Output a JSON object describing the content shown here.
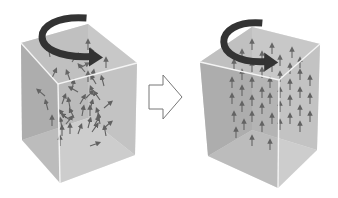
{
  "diagram": {
    "colors": {
      "background": "#ffffff",
      "face_back": "#b4b4b4",
      "face_side": "#c4c4c4",
      "face_front": "#a8a8a8",
      "face_top": "#cfcfcf",
      "face_bottom": "#d6d6d6",
      "edge": "#f4f4f4",
      "arrow": "#111111",
      "rotation_arrow": "#333333",
      "transition_arrow_stroke": "#777777"
    },
    "panels": [
      {
        "id": "before",
        "label": "random",
        "box": {
          "top_back_left": [
            21,
            43
          ],
          "top_back_right": [
            88,
            24
          ],
          "top_front_right": [
            137,
            63
          ],
          "top_front_left": [
            58,
            84
          ],
          "bottom_back_left": [
            22,
            140
          ],
          "bottom_front_left": [
            60,
            183
          ],
          "bottom_front_right": [
            135,
            155
          ],
          "hidden_back_bottom": [
            88,
            118
          ]
        },
        "rotation_arrow": {
          "cx": 70,
          "cy": 40,
          "rx": 30,
          "ry": 22
        },
        "arrows": [
          [
            50,
            57,
            -10
          ],
          [
            72,
            62,
            35
          ],
          [
            88,
            50,
            0
          ],
          [
            95,
            58,
            -25
          ],
          [
            106,
            68,
            0
          ],
          [
            80,
            68,
            60
          ],
          [
            85,
            72,
            -40
          ],
          [
            52,
            78,
            25
          ],
          [
            70,
            80,
            -20
          ],
          [
            88,
            82,
            0
          ],
          [
            92,
            80,
            10
          ],
          [
            96,
            84,
            -30
          ],
          [
            104,
            86,
            -15
          ],
          [
            72,
            90,
            10
          ],
          [
            78,
            92,
            -60
          ],
          [
            86,
            98,
            45
          ],
          [
            94,
            96,
            -20
          ],
          [
            100,
            100,
            -35
          ],
          [
            45,
            96,
            -50
          ],
          [
            62,
            104,
            20
          ],
          [
            70,
            108,
            -10
          ],
          [
            80,
            104,
            30
          ],
          [
            90,
            110,
            15
          ],
          [
            104,
            108,
            50
          ],
          [
            48,
            110,
            -15
          ],
          [
            66,
            118,
            -40
          ],
          [
            74,
            118,
            -25
          ],
          [
            82,
            116,
            10
          ],
          [
            90,
            116,
            0
          ],
          [
            100,
            118,
            -20
          ],
          [
            66,
            124,
            40
          ],
          [
            70,
            120,
            -55
          ],
          [
            52,
            126,
            0
          ],
          [
            62,
            128,
            -10
          ],
          [
            94,
            126,
            30
          ],
          [
            100,
            124,
            -10
          ],
          [
            104,
            128,
            50
          ],
          [
            62,
            136,
            0
          ],
          [
            70,
            134,
            0
          ],
          [
            78,
            134,
            20
          ],
          [
            88,
            128,
            15
          ],
          [
            92,
            132,
            35
          ],
          [
            106,
            136,
            -10
          ],
          [
            60,
            146,
            0
          ],
          [
            90,
            146,
            70
          ]
        ]
      },
      {
        "id": "after",
        "label": "aligned",
        "box": {
          "top_back_left": [
            200,
            62
          ],
          "top_back_right": [
            252,
            27
          ],
          "top_front_right": [
            320,
            44
          ],
          "top_front_left": [
            279,
            80
          ],
          "bottom_back_left": [
            208,
            156
          ],
          "bottom_front_left": [
            278,
            188
          ],
          "bottom_front_right": [
            317,
            150
          ],
          "hidden_back_bottom": [
            252,
            130
          ]
        },
        "rotation_arrow": {
          "cx": 248,
          "cy": 45,
          "rx": 26,
          "ry": 22
        },
        "arrows": [
          [
            252,
            50,
            0
          ],
          [
            272,
            54,
            0
          ],
          [
            292,
            58,
            0
          ],
          [
            242,
            60,
            0
          ],
          [
            262,
            62,
            0
          ],
          [
            280,
            66,
            0
          ],
          [
            300,
            68,
            0
          ],
          [
            234,
            70,
            0
          ],
          [
            252,
            72,
            0
          ],
          [
            272,
            72,
            0
          ],
          [
            290,
            74,
            0
          ],
          [
            242,
            80,
            0
          ],
          [
            262,
            78,
            0
          ],
          [
            280,
            82,
            0
          ],
          [
            300,
            80,
            0
          ],
          [
            232,
            88,
            0
          ],
          [
            252,
            88,
            0
          ],
          [
            270,
            88,
            0
          ],
          [
            290,
            90,
            0
          ],
          [
            310,
            86,
            0
          ],
          [
            242,
            96,
            0
          ],
          [
            262,
            98,
            0
          ],
          [
            280,
            98,
            0
          ],
          [
            300,
            98,
            0
          ],
          [
            232,
            104,
            0
          ],
          [
            252,
            106,
            0
          ],
          [
            270,
            104,
            0
          ],
          [
            290,
            106,
            0
          ],
          [
            310,
            104,
            0
          ],
          [
            242,
            112,
            0
          ],
          [
            262,
            114,
            0
          ],
          [
            280,
            112,
            0
          ],
          [
            300,
            116,
            0
          ],
          [
            234,
            122,
            0
          ],
          [
            252,
            122,
            0
          ],
          [
            272,
            124,
            0
          ],
          [
            290,
            124,
            0
          ],
          [
            310,
            122,
            0
          ],
          [
            244,
            130,
            0
          ],
          [
            262,
            132,
            0
          ],
          [
            280,
            130,
            0
          ],
          [
            300,
            132,
            0
          ],
          [
            236,
            138,
            0
          ],
          [
            252,
            146,
            0
          ],
          [
            270,
            150,
            0
          ]
        ]
      }
    ],
    "transition_arrow": {
      "direction": "right",
      "points": [
        [
          149,
          85
        ],
        [
          163,
          85
        ],
        [
          163,
          75
        ],
        [
          182,
          97
        ],
        [
          163,
          119
        ],
        [
          163,
          109
        ],
        [
          149,
          109
        ]
      ]
    }
  }
}
